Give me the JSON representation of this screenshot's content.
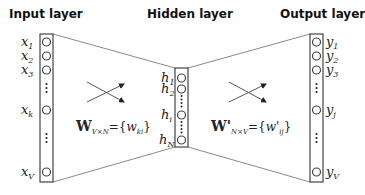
{
  "titles": {
    "input": "Input layer",
    "hidden": "Hidden layer",
    "output": "Output layer"
  },
  "input_nodes": {
    "x1": {
      "base": "x",
      "sub": "1"
    },
    "x2": {
      "base": "x",
      "sub": "2"
    },
    "x3": {
      "base": "x",
      "sub": "3"
    },
    "xk": {
      "base": "x",
      "sub": "k"
    },
    "xV": {
      "base": "x",
      "sub": "V"
    }
  },
  "hidden_nodes": {
    "h1": {
      "base": "h",
      "sub": "1"
    },
    "h2": {
      "base": "h",
      "sub": "2"
    },
    "hi": {
      "base": "h",
      "sub": "i"
    },
    "hN": {
      "base": "h",
      "sub": "N"
    }
  },
  "output_nodes": {
    "y1": {
      "base": "y",
      "sub": "1"
    },
    "y2": {
      "base": "y",
      "sub": "2"
    },
    "y3": {
      "base": "y",
      "sub": "3"
    },
    "yj": {
      "base": "y",
      "sub": "j"
    },
    "yV": {
      "base": "y",
      "sub": "V"
    }
  },
  "weights": {
    "input_hidden": {
      "symbol": "W",
      "sub": "V×N",
      "eq": "={",
      "elem": "w",
      "elem_sub": "ki",
      "close": "}"
    },
    "hidden_output": {
      "symbol": "W'",
      "sub": "N×V",
      "eq": "={",
      "elem": "w'",
      "elem_sub": "ij",
      "close": "}"
    }
  },
  "colors": {
    "line": "#8a8a8a",
    "box": "#444444",
    "node": "#444444",
    "text": "#222222"
  }
}
